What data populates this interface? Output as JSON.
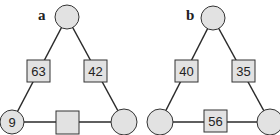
{
  "colors": {
    "fill": "#e2e2e2",
    "stroke": "#333333",
    "line": "#2a2a2a"
  },
  "puzzles": [
    {
      "label": "a",
      "top_circle": "",
      "bottom_left_circle": "9",
      "bottom_right_circle": "",
      "left_square": "63",
      "right_square": "42",
      "bottom_square": ""
    },
    {
      "label": "b",
      "top_circle": "",
      "bottom_left_circle": "",
      "bottom_right_circle": "",
      "left_square": "40",
      "right_square": "35",
      "bottom_square": "56"
    }
  ]
}
